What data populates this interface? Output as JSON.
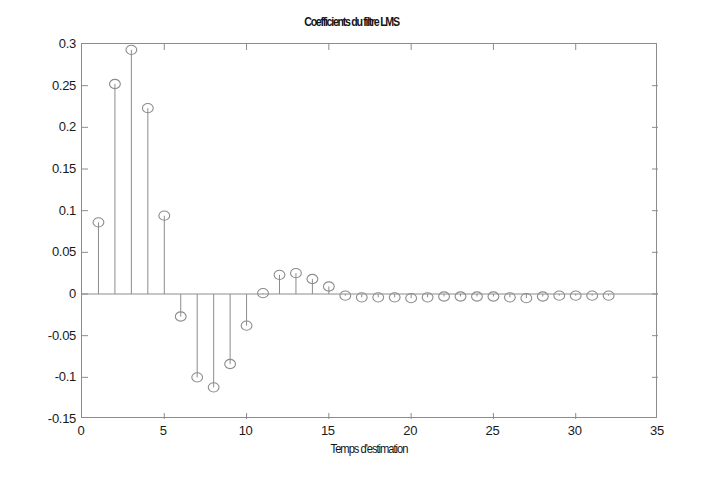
{
  "chart_data": {
    "type": "stem",
    "title": "Coefficients du filtre LMS",
    "subtitle": "",
    "xlabel": "Temps d'estimation",
    "ylabel": "",
    "xlim": [
      0,
      35
    ],
    "ylim": [
      -0.15,
      0.3
    ],
    "xticks": [
      0,
      5,
      10,
      15,
      20,
      25,
      30,
      35
    ],
    "xtick_labels": [
      "0",
      "5",
      "10",
      "15",
      "20",
      "25",
      "30",
      "35"
    ],
    "yticks": [
      -0.15,
      -0.1,
      -0.05,
      0,
      0.05,
      0.1,
      0.15,
      0.2,
      0.25,
      0.3
    ],
    "ytick_labels": [
      "-0.15",
      "-0.1",
      "-0.05",
      "0",
      "0.05",
      "0.1",
      "0.15",
      "0.2",
      "0.25",
      "0.3"
    ],
    "grid": false,
    "legend": null,
    "marker": "open-circle",
    "line_color": "#8c8c8c",
    "marker_color": "#8c8c8c",
    "axis_color": "#8c8c8c",
    "baseline": 0,
    "x": [
      1,
      2,
      3,
      4,
      5,
      6,
      7,
      8,
      9,
      10,
      11,
      12,
      13,
      14,
      15,
      16,
      17,
      18,
      19,
      20,
      21,
      22,
      23,
      24,
      25,
      26,
      27,
      28,
      29,
      30,
      31,
      32
    ],
    "values": [
      0.086,
      0.252,
      0.293,
      0.223,
      0.094,
      -0.027,
      -0.1,
      -0.112,
      -0.084,
      -0.038,
      0.001,
      0.023,
      0.025,
      0.018,
      0.009,
      -0.002,
      -0.004,
      -0.004,
      -0.004,
      -0.005,
      -0.004,
      -0.003,
      -0.003,
      -0.003,
      -0.003,
      -0.004,
      -0.005,
      -0.003,
      -0.002,
      -0.002,
      -0.002,
      -0.002
    ]
  },
  "figure": {
    "background": "#ffffff"
  }
}
